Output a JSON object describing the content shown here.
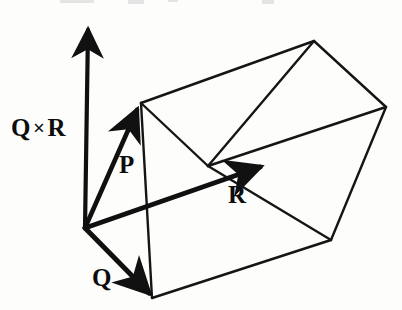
{
  "figure": {
    "kind": "vector-diagram",
    "background_color": "#fdfdfc",
    "ink_color": "#111111",
    "labels": {
      "cross_product": "Q",
      "cross_symbol": "×",
      "cross_product_second": "R",
      "vector_p": "P",
      "vector_r": "R",
      "vector_q": "Q"
    },
    "vectors": [
      {
        "name": "Q cross R",
        "label": "Q×R",
        "from": [
          85,
          228
        ],
        "to": [
          88,
          22
        ],
        "style": "heavy-arrow",
        "direction": "up"
      },
      {
        "name": "P",
        "label": "P",
        "from": [
          85,
          228
        ],
        "to": [
          138,
          105
        ],
        "style": "heavy-arrow",
        "direction": "up-right"
      },
      {
        "name": "R",
        "label": "R",
        "from": [
          85,
          228
        ],
        "to": [
          265,
          165
        ],
        "style": "heavy-arrow",
        "direction": "right"
      },
      {
        "name": "Q",
        "label": "Q",
        "from": [
          85,
          228
        ],
        "to": [
          152,
          298
        ],
        "style": "heavy-arrow",
        "direction": "down-right"
      }
    ],
    "solid_vertices": {
      "origin": [
        85,
        228
      ],
      "p_tip": [
        138,
        105
      ],
      "q_tip": [
        152,
        298
      ],
      "r_tip_interior": [
        208,
        165
      ],
      "top_back": [
        314,
        41
      ],
      "right_back": [
        386,
        107
      ],
      "bottom_right": [
        331,
        240
      ],
      "mid_upper_left": [
        141,
        103
      ],
      "mid_interior": [
        208,
        166
      ]
    },
    "edges": [
      {
        "name": "top-left-to-top-back",
        "from": [
          141,
          103
        ],
        "to": [
          314,
          41
        ]
      },
      {
        "name": "top-back-to-right-back",
        "from": [
          314,
          41
        ],
        "to": [
          386,
          107
        ]
      },
      {
        "name": "top-back-to-interior",
        "from": [
          314,
          41
        ],
        "to": [
          208,
          166
        ]
      },
      {
        "name": "interior-to-right-back",
        "from": [
          208,
          166
        ],
        "to": [
          386,
          107
        ]
      },
      {
        "name": "top-left-to-interior",
        "from": [
          141,
          103
        ],
        "to": [
          208,
          166
        ]
      },
      {
        "name": "interior-to-bottom-right",
        "from": [
          208,
          166
        ],
        "to": [
          331,
          240
        ]
      },
      {
        "name": "right-back-to-bottom-right",
        "from": [
          386,
          107
        ],
        "to": [
          331,
          240
        ]
      },
      {
        "name": "left-vertical",
        "from": [
          141,
          103
        ],
        "to": [
          152,
          298
        ]
      },
      {
        "name": "bottom-front",
        "from": [
          152,
          298
        ],
        "to": [
          331,
          240
        ]
      },
      {
        "name": "origin-to-q-tip-front",
        "from": [
          85,
          228
        ],
        "to": [
          152,
          298
        ]
      }
    ],
    "top_crop_fragments": 4
  }
}
